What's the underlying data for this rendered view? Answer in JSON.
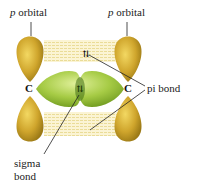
{
  "diagram": {
    "type": "pi and sigma bond orbital diagram",
    "labels": {
      "p_orbital_left": {
        "italic": "p",
        "rest": " orbital"
      },
      "p_orbital_right": {
        "italic": "p",
        "rest": " orbital"
      },
      "pi_bond": "pi bond",
      "sigma_bond_line1": "sigma",
      "sigma_bond_line2": "bond",
      "carbon_left": "C",
      "carbon_right": "C",
      "electron_pair_top": "⇅",
      "electron_pair_center": "⇅"
    },
    "colors": {
      "p_orbital": "#c9a227",
      "p_orbital_highlight": "#f0d45a",
      "sigma_orbital": "#9cc23a",
      "sigma_highlight": "#d4e98a",
      "pi_cloud": "#f2e6a8",
      "leader_line": "#222222"
    }
  }
}
